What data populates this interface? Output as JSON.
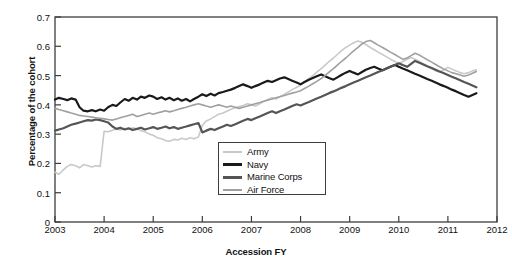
{
  "chart_data": {
    "type": "line",
    "title": "",
    "xlabel": "Accession FY",
    "ylabel": "Percentage of the cohort",
    "xlim": [
      2003,
      2012
    ],
    "ylim": [
      0,
      0.7
    ],
    "grid": false,
    "legend_position": "center-left-lower",
    "xticks": [
      "2003",
      "2004",
      "2005",
      "2006",
      "2007",
      "2008",
      "2009",
      "2010",
      "2011",
      "2012"
    ],
    "xtick_values": [
      2003,
      2004,
      2005,
      2006,
      2007,
      2008,
      2009,
      2010,
      2011,
      2012
    ],
    "yticks": [
      "0",
      "0.1",
      "0.2",
      "0.3",
      "0.4",
      "0.5",
      "0.6",
      "0.7"
    ],
    "ytick_values": [
      0,
      0.1,
      0.2,
      0.3,
      0.4,
      0.5,
      0.6,
      0.7
    ],
    "colors": {
      "army": "#c9c9c9",
      "navy": "#1a1a1a",
      "marine_corps": "#555555",
      "air_force": "#a0a0a0"
    },
    "x": [
      2003.0,
      2003.08,
      2003.17,
      2003.25,
      2003.33,
      2003.42,
      2003.5,
      2003.58,
      2003.67,
      2003.75,
      2003.83,
      2003.92,
      2004.0,
      2004.08,
      2004.17,
      2004.25,
      2004.33,
      2004.42,
      2004.5,
      2004.58,
      2004.67,
      2004.75,
      2004.83,
      2004.92,
      2005.0,
      2005.08,
      2005.17,
      2005.25,
      2005.33,
      2005.42,
      2005.5,
      2005.58,
      2005.67,
      2005.75,
      2005.83,
      2005.92,
      2006.0,
      2006.08,
      2006.17,
      2006.25,
      2006.33,
      2006.42,
      2006.5,
      2006.58,
      2006.67,
      2006.75,
      2006.83,
      2006.92,
      2007.0,
      2007.08,
      2007.17,
      2007.25,
      2007.33,
      2007.42,
      2007.5,
      2007.58,
      2007.67,
      2007.75,
      2007.83,
      2007.92,
      2008.0,
      2008.08,
      2008.17,
      2008.25,
      2008.33,
      2008.42,
      2008.5,
      2008.58,
      2008.67,
      2008.75,
      2008.83,
      2008.92,
      2009.0,
      2009.08,
      2009.17,
      2009.25,
      2009.33,
      2009.42,
      2009.5,
      2009.58,
      2009.67,
      2009.75,
      2009.83,
      2009.92,
      2010.0,
      2010.08,
      2010.17,
      2010.25,
      2010.33,
      2010.42,
      2010.5,
      2010.58,
      2010.67,
      2010.75,
      2010.83,
      2010.92,
      2011.0,
      2011.08,
      2011.17,
      2011.25,
      2011.33,
      2011.42,
      2011.5,
      2011.58
    ],
    "series": [
      {
        "name": "Army",
        "color": "#c9c9c9",
        "width": 1.6,
        "values": [
          0.17,
          0.163,
          0.178,
          0.19,
          0.196,
          0.192,
          0.185,
          0.196,
          0.192,
          0.188,
          0.192,
          0.19,
          0.31,
          0.308,
          0.313,
          0.318,
          0.314,
          0.32,
          0.316,
          0.322,
          0.318,
          0.312,
          0.308,
          0.3,
          0.296,
          0.288,
          0.284,
          0.278,
          0.276,
          0.282,
          0.28,
          0.286,
          0.282,
          0.288,
          0.284,
          0.29,
          0.33,
          0.345,
          0.352,
          0.36,
          0.368,
          0.372,
          0.378,
          0.385,
          0.39,
          0.394,
          0.398,
          0.404,
          0.4,
          0.396,
          0.404,
          0.412,
          0.418,
          0.424,
          0.42,
          0.428,
          0.436,
          0.444,
          0.452,
          0.46,
          0.468,
          0.478,
          0.49,
          0.5,
          0.512,
          0.524,
          0.536,
          0.548,
          0.56,
          0.572,
          0.584,
          0.596,
          0.604,
          0.612,
          0.618,
          0.614,
          0.606,
          0.596,
          0.588,
          0.58,
          0.572,
          0.564,
          0.556,
          0.548,
          0.54,
          0.548,
          0.556,
          0.562,
          0.556,
          0.548,
          0.54,
          0.532,
          0.524,
          0.516,
          0.512,
          0.52,
          0.528,
          0.522,
          0.516,
          0.51,
          0.506,
          0.51,
          0.516,
          0.52
        ]
      },
      {
        "name": "Navy",
        "color": "#1a1a1a",
        "width": 2.2,
        "values": [
          0.418,
          0.424,
          0.42,
          0.416,
          0.422,
          0.418,
          0.392,
          0.38,
          0.378,
          0.382,
          0.378,
          0.384,
          0.38,
          0.392,
          0.4,
          0.396,
          0.408,
          0.42,
          0.414,
          0.424,
          0.418,
          0.428,
          0.424,
          0.432,
          0.428,
          0.42,
          0.426,
          0.418,
          0.424,
          0.416,
          0.422,
          0.414,
          0.42,
          0.412,
          0.42,
          0.428,
          0.436,
          0.43,
          0.438,
          0.432,
          0.44,
          0.444,
          0.448,
          0.452,
          0.458,
          0.464,
          0.47,
          0.464,
          0.458,
          0.464,
          0.47,
          0.476,
          0.482,
          0.478,
          0.484,
          0.49,
          0.494,
          0.488,
          0.482,
          0.476,
          0.47,
          0.478,
          0.486,
          0.492,
          0.498,
          0.504,
          0.498,
          0.492,
          0.486,
          0.494,
          0.502,
          0.51,
          0.516,
          0.51,
          0.504,
          0.512,
          0.52,
          0.526,
          0.53,
          0.524,
          0.518,
          0.524,
          0.53,
          0.536,
          0.53,
          0.524,
          0.518,
          0.512,
          0.506,
          0.5,
          0.494,
          0.488,
          0.482,
          0.476,
          0.47,
          0.464,
          0.458,
          0.452,
          0.446,
          0.44,
          0.434,
          0.428,
          0.434,
          0.44
        ]
      },
      {
        "name": "Marine Corps",
        "color": "#555555",
        "width": 2.2,
        "values": [
          0.312,
          0.316,
          0.32,
          0.326,
          0.332,
          0.336,
          0.34,
          0.344,
          0.348,
          0.346,
          0.35,
          0.348,
          0.344,
          0.34,
          0.326,
          0.318,
          0.322,
          0.316,
          0.32,
          0.314,
          0.318,
          0.322,
          0.316,
          0.32,
          0.324,
          0.318,
          0.322,
          0.326,
          0.32,
          0.324,
          0.318,
          0.322,
          0.326,
          0.33,
          0.334,
          0.338,
          0.306,
          0.312,
          0.318,
          0.314,
          0.32,
          0.326,
          0.332,
          0.328,
          0.334,
          0.34,
          0.346,
          0.352,
          0.348,
          0.354,
          0.36,
          0.366,
          0.372,
          0.378,
          0.372,
          0.378,
          0.384,
          0.39,
          0.396,
          0.402,
          0.398,
          0.404,
          0.41,
          0.416,
          0.422,
          0.428,
          0.434,
          0.44,
          0.446,
          0.452,
          0.458,
          0.464,
          0.47,
          0.476,
          0.482,
          0.488,
          0.494,
          0.5,
          0.506,
          0.512,
          0.518,
          0.524,
          0.53,
          0.536,
          0.542,
          0.536,
          0.53,
          0.54,
          0.55,
          0.544,
          0.538,
          0.532,
          0.526,
          0.52,
          0.514,
          0.508,
          0.502,
          0.496,
          0.49,
          0.484,
          0.478,
          0.472,
          0.466,
          0.46
        ]
      },
      {
        "name": "Air Force",
        "color": "#a0a0a0",
        "width": 1.6,
        "values": [
          0.388,
          0.384,
          0.38,
          0.376,
          0.372,
          0.368,
          0.364,
          0.362,
          0.36,
          0.358,
          0.356,
          0.354,
          0.352,
          0.35,
          0.348,
          0.352,
          0.356,
          0.36,
          0.364,
          0.368,
          0.36,
          0.364,
          0.368,
          0.372,
          0.368,
          0.372,
          0.376,
          0.38,
          0.376,
          0.38,
          0.384,
          0.388,
          0.392,
          0.396,
          0.4,
          0.404,
          0.4,
          0.396,
          0.392,
          0.396,
          0.4,
          0.396,
          0.392,
          0.396,
          0.392,
          0.388,
          0.392,
          0.396,
          0.4,
          0.404,
          0.408,
          0.412,
          0.416,
          0.42,
          0.424,
          0.428,
          0.432,
          0.436,
          0.44,
          0.444,
          0.448,
          0.456,
          0.464,
          0.472,
          0.48,
          0.49,
          0.5,
          0.512,
          0.524,
          0.536,
          0.548,
          0.56,
          0.572,
          0.584,
          0.596,
          0.608,
          0.616,
          0.62,
          0.612,
          0.604,
          0.596,
          0.588,
          0.58,
          0.572,
          0.564,
          0.556,
          0.56,
          0.568,
          0.576,
          0.57,
          0.562,
          0.554,
          0.546,
          0.538,
          0.53,
          0.522,
          0.516,
          0.51,
          0.506,
          0.502,
          0.498,
          0.502,
          0.508,
          0.514
        ]
      }
    ]
  },
  "legend": {
    "items": [
      {
        "label": "Army"
      },
      {
        "label": "Navy"
      },
      {
        "label": "Marine Corps"
      },
      {
        "label": "Air Force"
      }
    ]
  },
  "axis": {
    "ylabel": "Percentage of the cohort",
    "xlabel": "Accession FY"
  }
}
